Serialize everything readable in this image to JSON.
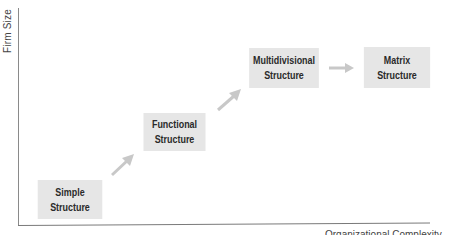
{
  "diagram": {
    "axes": {
      "y_label": "Firm Size",
      "x_label": "Organizational Complexity"
    },
    "nodes": [
      {
        "id": "simple",
        "line1": "Simple",
        "line2": "Structure"
      },
      {
        "id": "functional",
        "line1": "Functional",
        "line2": "Structure"
      },
      {
        "id": "multidivisional",
        "line1": "Multidivisional",
        "line2": "Structure"
      },
      {
        "id": "matrix",
        "line1": "Matrix",
        "line2": "Structure"
      }
    ],
    "edges": [
      {
        "from": "simple",
        "to": "functional",
        "icon": "arrow-up-right-icon"
      },
      {
        "from": "functional",
        "to": "multidivisional",
        "icon": "arrow-up-right-icon"
      },
      {
        "from": "multidivisional",
        "to": "matrix",
        "icon": "arrow-right-icon"
      }
    ],
    "colors": {
      "box_fill": "#e6e6e6",
      "arrow": "#c8c8c8",
      "axis": "#7a7a7a",
      "text": "#2a2a2a"
    }
  }
}
